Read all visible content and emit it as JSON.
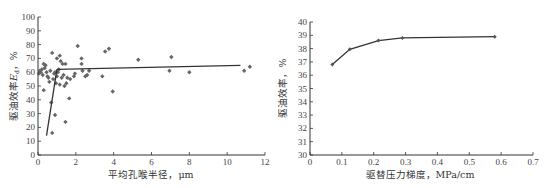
{
  "chart_data": [
    {
      "type": "scatter",
      "title": "",
      "xlabel": "平均孔喉半径，μm",
      "ylabel": "驱油效率E_d，%",
      "xlim": [
        0,
        12
      ],
      "ylim": [
        0,
        100
      ],
      "xticks": [
        0,
        2,
        4,
        6,
        8,
        10,
        12
      ],
      "yticks": [
        0,
        10,
        20,
        30,
        40,
        50,
        60,
        70,
        80,
        90,
        100
      ],
      "grid": false,
      "marker": "diamond",
      "points": [
        [
          0.05,
          59
        ],
        [
          0.1,
          61
        ],
        [
          0.15,
          60
        ],
        [
          0.2,
          62
        ],
        [
          0.25,
          58
        ],
        [
          0.3,
          66
        ],
        [
          0.35,
          63
        ],
        [
          0.4,
          65
        ],
        [
          0.3,
          47
        ],
        [
          0.45,
          60
        ],
        [
          0.5,
          57
        ],
        [
          0.55,
          56
        ],
        [
          0.6,
          53
        ],
        [
          0.65,
          61
        ],
        [
          0.7,
          38
        ],
        [
          0.75,
          74
        ],
        [
          0.75,
          16
        ],
        [
          0.8,
          55
        ],
        [
          0.85,
          59
        ],
        [
          0.9,
          60
        ],
        [
          0.9,
          29
        ],
        [
          0.95,
          52
        ],
        [
          1.0,
          70
        ],
        [
          1.0,
          57
        ],
        [
          1.05,
          60
        ],
        [
          1.1,
          62
        ],
        [
          1.15,
          72
        ],
        [
          1.15,
          51
        ],
        [
          1.2,
          68
        ],
        [
          1.25,
          56
        ],
        [
          1.3,
          66
        ],
        [
          1.35,
          58
        ],
        [
          1.4,
          50
        ],
        [
          1.45,
          66
        ],
        [
          1.45,
          24
        ],
        [
          1.5,
          52
        ],
        [
          1.55,
          56
        ],
        [
          1.65,
          41
        ],
        [
          1.7,
          55
        ],
        [
          1.9,
          57
        ],
        [
          1.95,
          59
        ],
        [
          2.1,
          79
        ],
        [
          2.3,
          70
        ],
        [
          2.3,
          66
        ],
        [
          2.35,
          61
        ],
        [
          2.5,
          57
        ],
        [
          2.6,
          58
        ],
        [
          2.7,
          61
        ],
        [
          3.4,
          57
        ],
        [
          3.55,
          75
        ],
        [
          3.75,
          77
        ],
        [
          3.95,
          46
        ],
        [
          5.3,
          69
        ],
        [
          6.95,
          61
        ],
        [
          7.05,
          71
        ],
        [
          8.0,
          60
        ],
        [
          10.9,
          61
        ],
        [
          11.2,
          64
        ]
      ],
      "trend_lines": [
        {
          "name": "steep segment",
          "x": [
            0.45,
            1.0
          ],
          "y": [
            14,
            62
          ]
        },
        {
          "name": "plateau segment",
          "x": [
            1.0,
            10.7
          ],
          "y": [
            62,
            65
          ]
        }
      ]
    },
    {
      "type": "line",
      "title": "",
      "xlabel": "驱替压力梯度，MPa/cm",
      "ylabel": "驱油效率，%",
      "xlim": [
        0,
        0.7
      ],
      "ylim": [
        30,
        40
      ],
      "xticks": [
        0,
        0.1,
        0.2,
        0.3,
        0.4,
        0.5,
        0.6,
        0.7
      ],
      "yticks": [
        30,
        31,
        32,
        33,
        34,
        35,
        36,
        37,
        38,
        39,
        40
      ],
      "grid": false,
      "series": [
        {
          "name": "驱油效率",
          "x": [
            0.07,
            0.125,
            0.215,
            0.29,
            0.58
          ],
          "values": [
            36.8,
            37.95,
            38.6,
            38.8,
            38.9
          ]
        }
      ]
    }
  ],
  "left": {
    "xlabel": "平均孔喉半径，μm",
    "ylabel_main": "驱油效率",
    "ylabel_var": "E",
    "ylabel_sub": "d",
    "ylabel_unit": "，%"
  },
  "right": {
    "xlabel": "驱替压力梯度，MPa/cm",
    "ylabel": "驱油效率，%"
  }
}
